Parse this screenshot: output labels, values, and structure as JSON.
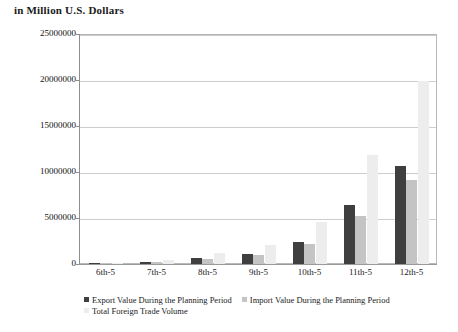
{
  "chart_data": {
    "type": "bar",
    "title": "in Million U.S. Dollars",
    "xlabel": "",
    "ylabel": "",
    "ylim": [
      0,
      25000000
    ],
    "ytick_values": [
      0,
      5000000,
      10000000,
      15000000,
      20000000,
      25000000
    ],
    "ytick_labels": [
      "0",
      "5000000",
      "10000000",
      "15000000",
      "20000000",
      "25000000"
    ],
    "grid": true,
    "legend_position": "bottom",
    "categories": [
      "6th-5",
      "7th-5",
      "8th-5",
      "9th-5",
      "10th-5",
      "11th-5",
      "12th-5"
    ],
    "series": [
      {
        "name": "Export Value During the Planning Period",
        "color": "#3f3f3f",
        "values": [
          56000,
          262000,
          658000,
          1080000,
          2400000,
          6430000,
          10700000
        ]
      },
      {
        "name": "Import Value During the Planning Period",
        "color": "#c4c4c4",
        "values": [
          61000,
          218000,
          546000,
          1000000,
          2180000,
          5200000,
          9100000
        ]
      },
      {
        "name": "Total Foreign Trade Volume",
        "color": "#ededed",
        "values": [
          117000,
          480000,
          1200000,
          2080000,
          4550000,
          11800000,
          19900000
        ]
      }
    ]
  },
  "legend": {
    "row1": [
      "Export Value During the Planning Period",
      "Import Value During the Planning Period"
    ],
    "row2": [
      "Total Foreign Trade Volume"
    ]
  }
}
